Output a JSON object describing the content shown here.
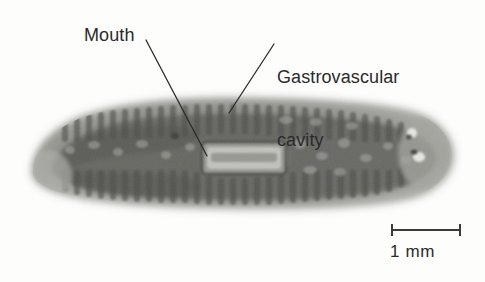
{
  "figure": {
    "type": "labeled-micrograph",
    "background_color": "#fdfdfc",
    "text_color": "#2b2b2b"
  },
  "annotations": [
    {
      "id": "mouth",
      "label": "Mouth",
      "leader_from": [
        146,
        40
      ],
      "leader_to": [
        207,
        156
      ]
    },
    {
      "id": "gastrovascular-cavity",
      "label_line1": "Gastrovascular",
      "label_line2": "cavity",
      "leader_from": [
        274,
        44
      ],
      "leader_to": [
        229,
        113
      ]
    }
  ],
  "scale_bar": {
    "label": "1 mm",
    "x_start": 391,
    "x_end": 461,
    "y": 230,
    "cap_height": 11,
    "color": "#3a3a3a"
  },
  "specimen": {
    "name": "planarian",
    "body_fill": "#8e8e8a",
    "body_edge": "#b9b9b5",
    "gut_dark": "#5d5d5a",
    "pharynx_fill": "#b4b4b0",
    "pharynx_outline": "#595956",
    "eyespot_fill": "#e3e3df",
    "left_tip_x": 30,
    "right_tip_x": 452,
    "top_y": 99,
    "bottom_y": 207,
    "pharynx": {
      "x": 203,
      "y": 143,
      "width": 82,
      "height": 30
    },
    "eyespots": [
      [
        412,
        133
      ],
      [
        418,
        156
      ]
    ]
  }
}
